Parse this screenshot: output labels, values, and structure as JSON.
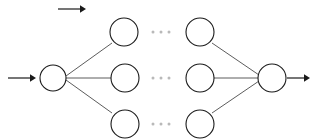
{
  "figure": {
    "kind": "neural-network-diagram",
    "width": 317,
    "height": 139,
    "background_color": "#ffffff",
    "node_stroke_color": "#1a1a1a",
    "node_fill_color": "#ffffff",
    "edge_color": "#4a4a4a",
    "arrow_color": "#1a1a1a",
    "ellipsis_color": "#b9b9b9"
  },
  "annotation_arrow": {
    "label": "",
    "x1": 58,
    "y1": 9,
    "x2": 86,
    "y2": 9
  },
  "input_arrow": {
    "label": "",
    "x1": 8,
    "y1": 78,
    "x2": 36,
    "y2": 78
  },
  "output_arrow": {
    "label": "",
    "x1": 287,
    "y1": 78,
    "x2": 310,
    "y2": 78
  },
  "layers": [
    {
      "id": "input-layer",
      "name": "input",
      "nodes": [
        {
          "id": "input-node",
          "label": "",
          "cx": 53,
          "cy": 78,
          "r": 13
        }
      ]
    },
    {
      "id": "hidden-layer-first",
      "name": "hidden-first",
      "nodes": [
        {
          "id": "hidden-first-top",
          "label": "",
          "cx": 124,
          "cy": 32,
          "r": 14
        },
        {
          "id": "hidden-first-middle",
          "label": "",
          "cx": 125,
          "cy": 78,
          "r": 14
        },
        {
          "id": "hidden-first-bottom",
          "label": "",
          "cx": 125,
          "cy": 124,
          "r": 14
        }
      ]
    },
    {
      "id": "hidden-layer-last",
      "name": "hidden-last",
      "nodes": [
        {
          "id": "hidden-last-top",
          "label": "",
          "cx": 200,
          "cy": 32,
          "r": 14
        },
        {
          "id": "hidden-last-middle",
          "label": "",
          "cx": 200,
          "cy": 78,
          "r": 14
        },
        {
          "id": "hidden-last-bottom",
          "label": "",
          "cx": 200,
          "cy": 124,
          "r": 14
        }
      ]
    },
    {
      "id": "output-layer",
      "name": "output",
      "nodes": [
        {
          "id": "output-node",
          "label": "",
          "cx": 272,
          "cy": 78,
          "r": 14
        }
      ]
    }
  ],
  "edges": [
    {
      "id": "edge-input-to-top",
      "from": "input-node",
      "to": "hidden-first-top",
      "x1": 66,
      "y1": 76,
      "x2": 112,
      "y2": 43
    },
    {
      "id": "edge-input-to-middle",
      "from": "input-node",
      "to": "hidden-first-middle",
      "x1": 66,
      "y1": 78,
      "x2": 111,
      "y2": 78
    },
    {
      "id": "edge-input-to-bottom",
      "from": "input-node",
      "to": "hidden-first-bottom",
      "x1": 66,
      "y1": 80,
      "x2": 112,
      "y2": 113
    },
    {
      "id": "edge-top-to-output",
      "from": "hidden-last-top",
      "to": "output-node",
      "x1": 212,
      "y1": 43,
      "x2": 259,
      "y2": 75
    },
    {
      "id": "edge-middle-to-output",
      "from": "hidden-last-middle",
      "to": "output-node",
      "x1": 214,
      "y1": 78,
      "x2": 258,
      "y2": 78
    },
    {
      "id": "edge-bottom-to-output",
      "from": "hidden-last-bottom",
      "to": "output-node",
      "x1": 212,
      "y1": 113,
      "x2": 259,
      "y2": 81
    }
  ],
  "ellipses": [
    {
      "id": "ellipsis-top",
      "text": "...",
      "cy": 32,
      "dots": [
        153,
        161,
        169
      ]
    },
    {
      "id": "ellipsis-middle",
      "text": "...",
      "cy": 78,
      "dots": [
        153,
        161,
        169
      ]
    },
    {
      "id": "ellipsis-bottom",
      "text": "...",
      "cy": 124,
      "dots": [
        153,
        161,
        169
      ]
    }
  ]
}
